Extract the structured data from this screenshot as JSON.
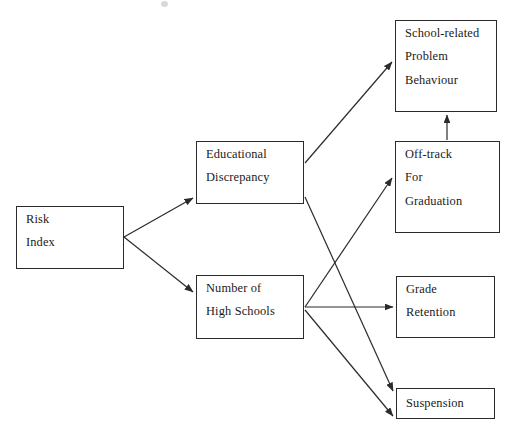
{
  "diagram": {
    "background_color": "#ffffff",
    "line_color": "#2b2b2b",
    "text_color": "#1a1a1a",
    "nodes": [
      {
        "id": "risk-index",
        "lines": [
          "Risk",
          "Index"
        ]
      },
      {
        "id": "educational",
        "lines": [
          "Educational",
          "Discrepancy"
        ]
      },
      {
        "id": "highschools",
        "lines": [
          "Number of",
          "High Schools"
        ]
      },
      {
        "id": "school-related",
        "lines": [
          "School-related",
          "Problem",
          "Behaviour"
        ]
      },
      {
        "id": "offtrack",
        "lines": [
          "Off-track",
          "For",
          "Graduation"
        ]
      },
      {
        "id": "grade-retention",
        "lines": [
          "Grade",
          "Retention"
        ]
      },
      {
        "id": "suspension",
        "lines": [
          "Suspension"
        ]
      }
    ],
    "edges": [
      {
        "id": "risk-to-educational",
        "from": "risk-index",
        "to": "educational"
      },
      {
        "id": "risk-to-highschools",
        "from": "risk-index",
        "to": "highschools"
      },
      {
        "id": "educational-to-school",
        "from": "educational",
        "to": "school-related"
      },
      {
        "id": "educational-to-suspension",
        "from": "educational",
        "to": "suspension"
      },
      {
        "id": "highschools-to-offtrack",
        "from": "highschools",
        "to": "offtrack"
      },
      {
        "id": "highschools-to-grade",
        "from": "highschools",
        "to": "grade-retention"
      },
      {
        "id": "highschools-to-suspension",
        "from": "highschools",
        "to": "suspension"
      },
      {
        "id": "offtrack-to-school",
        "from": "offtrack",
        "to": "school-related"
      }
    ]
  }
}
